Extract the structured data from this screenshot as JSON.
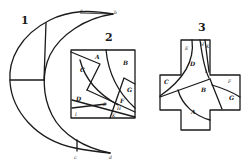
{
  "figures": [
    {
      "number": "1",
      "description": "crescent moon shape",
      "point_labels": [
        "a",
        "b",
        "c",
        "d"
      ]
    },
    {
      "number": "2",
      "description": "square dissection",
      "piece_labels": [
        "A",
        "B",
        "C",
        "D",
        "E",
        "F",
        "G",
        "H",
        "I",
        "K"
      ]
    },
    {
      "number": "3",
      "description": "Greek cross reassembly",
      "piece_labels": [
        "A",
        "B",
        "C",
        "D",
        "E",
        "F",
        "G",
        "H",
        "I",
        "K"
      ]
    }
  ],
  "colors": {
    "ink": "#1a1a1a",
    "paper": "#ffffff"
  }
}
